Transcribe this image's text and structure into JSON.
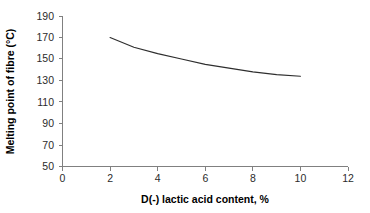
{
  "chart_data": {
    "type": "line",
    "title": "",
    "subtitle": "",
    "xlabel": "D(-) lactic acid content, %",
    "ylabel": "Melting point of fibre (°C)",
    "xlim": [
      0,
      12
    ],
    "ylim": [
      50,
      190
    ],
    "xticks": [
      "0",
      "2",
      "4",
      "6",
      "8",
      "10",
      "12"
    ],
    "yticks": [
      "50",
      "70",
      "90",
      "110",
      "130",
      "150",
      "170",
      "190"
    ],
    "grid": false,
    "legend": false,
    "legend_position": "none",
    "line_color": "#2e2e2e",
    "axis_color": "#808080",
    "background_color": "#ffffff",
    "x": [
      2,
      3,
      4,
      5,
      6,
      7,
      8,
      9,
      10
    ],
    "values": [
      170,
      161,
      155,
      150,
      145,
      141.5,
      138,
      135.5,
      134
    ],
    "series": [
      {
        "name": "Melting point",
        "x": [
          2,
          3,
          4,
          5,
          6,
          7,
          8,
          9,
          10
        ],
        "values": [
          170,
          161,
          155,
          150,
          145,
          141.5,
          138,
          135.5,
          134
        ]
      }
    ],
    "annotations": []
  }
}
